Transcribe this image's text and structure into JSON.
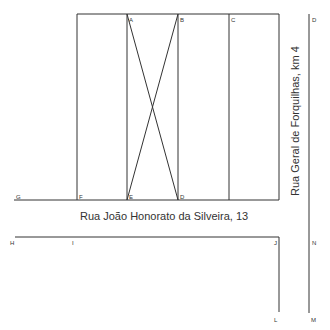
{
  "diagram": {
    "streets": {
      "bottom": "Rua João Honorato da Silveira, 13",
      "right": "Rua Geral de Forquilhas, km 4"
    },
    "points": {
      "A": "A",
      "B": "B",
      "C": "C",
      "D_top": "D",
      "E": "E",
      "F": "F",
      "G": "G",
      "D_bottom": "D",
      "H": "H",
      "I": "I",
      "J": "J",
      "L": "L",
      "M": "M",
      "N": "N"
    },
    "colors": {
      "line": "#333333",
      "background": "#ffffff"
    }
  }
}
